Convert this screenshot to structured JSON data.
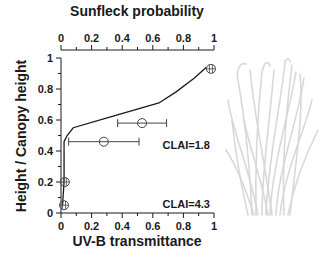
{
  "chart_data": {
    "type": "line",
    "top_axis": {
      "label": "Sunfleck probability",
      "ticks": [
        "0",
        "0.2",
        "0.4",
        "0.6",
        "0.8",
        "1"
      ],
      "range": [
        0,
        1
      ]
    },
    "bottom_axis": {
      "label": "UV-B transmittance",
      "ticks": [
        "0",
        "0.2",
        "0.4",
        "0.6",
        "0.8",
        "1"
      ],
      "range": [
        0,
        1
      ]
    },
    "left_axis": {
      "label": "Height / Canopy height",
      "ticks": [
        "0",
        "0.2",
        "0.4",
        "0.6",
        "0.8",
        "1"
      ],
      "range": [
        0,
        1
      ]
    },
    "series": [
      {
        "name": "Sunfleck probability profile",
        "type": "line",
        "x": [
          0.95,
          0.87,
          0.75,
          0.64,
          0.29,
          0.08,
          0.04,
          0.02,
          0.02,
          0.01
        ],
        "y": [
          0.94,
          0.87,
          0.78,
          0.71,
          0.61,
          0.55,
          0.5,
          0.46,
          0.2,
          0.05
        ]
      },
      {
        "name": "UV-B transmittance",
        "type": "scatter",
        "points": [
          {
            "x": 0.98,
            "y": 0.93,
            "xerr_low": 0.975,
            "xerr_high": 0.985
          },
          {
            "x": 0.53,
            "y": 0.58,
            "xerr_low": 0.37,
            "xerr_high": 0.69
          },
          {
            "x": 0.28,
            "y": 0.46,
            "xerr_low": 0.05,
            "xerr_high": 0.51
          },
          {
            "x": 0.025,
            "y": 0.2,
            "xerr_low": 0.02,
            "xerr_high": 0.03
          },
          {
            "x": 0.02,
            "y": 0.05,
            "xerr_low": 0.015,
            "xerr_high": 0.025
          }
        ]
      }
    ],
    "annotations": [
      {
        "text": "CLAI=1.8",
        "x": 0.82,
        "y": 0.44
      },
      {
        "text": "CLAI=4.3",
        "x": 0.82,
        "y": 0.05
      }
    ],
    "grid": false,
    "legend": null
  },
  "labels": {
    "top_title": "Sunfleck probability",
    "bottom_title": "UV-B transmittance",
    "left_title": "Height / Canopy height",
    "clai_upper": "CLAI=1.8",
    "clai_lower": "CLAI=4.3",
    "top_ticks": [
      "0",
      "0.2",
      "0.4",
      "0.6",
      "0.8",
      "1"
    ],
    "bottom_ticks": [
      "0",
      "0.2",
      "0.4",
      "0.6",
      "0.8",
      "1"
    ],
    "left_ticks": [
      "0",
      "0.2",
      "0.4",
      "0.6",
      "0.8",
      "1"
    ]
  },
  "colors": {
    "axis": "#1a1a1a",
    "line": "#1a1a1a",
    "marker": "#444444",
    "illustration": "#d8d8d8"
  }
}
